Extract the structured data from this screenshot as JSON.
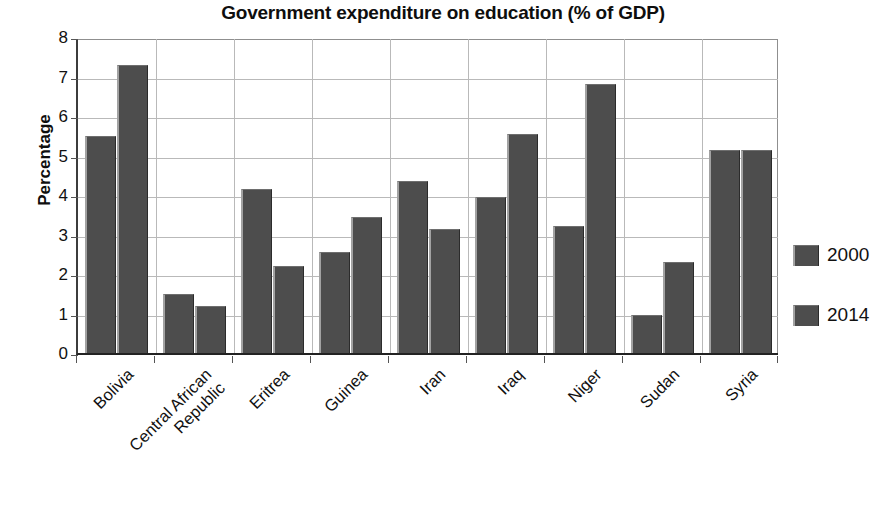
{
  "chart_data": {
    "type": "bar",
    "title": "Government expenditure on education (% of GDP)",
    "xlabel": "",
    "ylabel": "Percentage",
    "ylim": [
      0,
      8
    ],
    "ytick_labels": [
      "8",
      "7",
      "6",
      "5",
      "4",
      "3",
      "2",
      "1",
      "0"
    ],
    "ytick_values": [
      8,
      7,
      6,
      5,
      4,
      3,
      2,
      1,
      0
    ],
    "grid": true,
    "legend_position": "right",
    "categories": [
      "Bolivia",
      "Central African Republic",
      "Eritrea",
      "Guinea",
      "Iran",
      "Iraq",
      "Niger",
      "Sudan",
      "Syria"
    ],
    "category_label_lines": [
      [
        "Bolivia"
      ],
      [
        "Central African",
        "Republic"
      ],
      [
        "Eritrea"
      ],
      [
        "Guinea"
      ],
      [
        "Iran"
      ],
      [
        "Iraq"
      ],
      [
        "Niger"
      ],
      [
        "Sudan"
      ],
      [
        "Syria"
      ]
    ],
    "series": [
      {
        "name": "2000",
        "color": "#4d4d4d",
        "values": [
          5.5,
          1.5,
          4.15,
          2.57,
          4.35,
          3.95,
          3.22,
          0.97,
          5.15
        ]
      },
      {
        "name": "2014",
        "color": "#4d4d4d",
        "values": [
          7.3,
          1.2,
          2.2,
          3.45,
          3.15,
          5.55,
          6.8,
          2.3,
          5.15
        ]
      }
    ]
  },
  "legend": {
    "items": [
      {
        "label": "2000",
        "color": "#4d4d4d"
      },
      {
        "label": "2014",
        "color": "#4d4d4d"
      }
    ]
  },
  "colors": {
    "bar_fill": "#4d4d4d",
    "grid": "#b9b9b9",
    "axis": "#222222",
    "text": "#111111",
    "background": "#ffffff"
  }
}
